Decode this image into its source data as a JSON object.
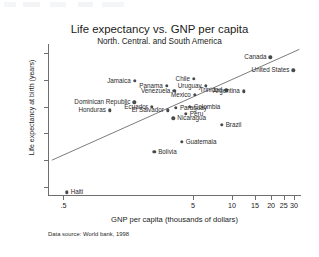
{
  "chart_data": {
    "type": "scatter",
    "title": "Life expectancy vs. GNP per capita",
    "subtitle": "North, Central, and South America",
    "xlabel": "GNP per capita (thousands of dollars)",
    "ylabel": "Life expectancy at birth (years)",
    "note": "Data source:  World bank, 1998",
    "xscale": "log",
    "yscale": "linear",
    "xlim": [
      0.38,
      34
    ],
    "ylim": [
      53.4,
      81.6
    ],
    "grid": false,
    "legend": false,
    "xticks": [
      ".5",
      "5",
      "10",
      "15",
      "20",
      "25",
      "30"
    ],
    "xtickvalues": [
      0.5,
      5,
      10,
      15,
      20,
      25,
      30
    ],
    "yticks": [
      "55",
      "60",
      "65",
      "70",
      "75",
      "80"
    ],
    "ytickvalues": [
      55,
      60,
      65,
      70,
      75,
      80
    ],
    "points": [
      {
        "name": "Canada",
        "x": 19.4,
        "y": 79.1,
        "side": "left"
      },
      {
        "name": "United States",
        "x": 29.2,
        "y": 76.7,
        "side": "left"
      },
      {
        "name": "Jamaica",
        "x": 1.74,
        "y": 74.8,
        "side": "left"
      },
      {
        "name": "Chile",
        "x": 4.99,
        "y": 75.1,
        "side": "left"
      },
      {
        "name": "Panama",
        "x": 3.08,
        "y": 73.9,
        "side": "left"
      },
      {
        "name": "Uruguay",
        "x": 6.13,
        "y": 73.9,
        "side": "left"
      },
      {
        "name": "Venezuela",
        "x": 3.52,
        "y": 72.9,
        "side": "left"
      },
      {
        "name": "Trinidad",
        "x": 8.85,
        "y": 73.0,
        "side": "left"
      },
      {
        "name": "Argentina",
        "x": 12.1,
        "y": 72.8,
        "side": "left"
      },
      {
        "name": "Mexico",
        "x": 5.07,
        "y": 72.2,
        "side": "left"
      },
      {
        "name": "Dominican Republic",
        "x": 1.73,
        "y": 70.8,
        "side": "left"
      },
      {
        "name": "Ecuador",
        "x": 2.36,
        "y": 69.9,
        "side": "left"
      },
      {
        "name": "Paraguay",
        "x": 3.62,
        "y": 69.8,
        "side": "right"
      },
      {
        "name": "Colombia",
        "x": 4.63,
        "y": 70.0,
        "side": "right"
      },
      {
        "name": "Honduras",
        "x": 1.12,
        "y": 69.3,
        "side": "left"
      },
      {
        "name": "El Salvador",
        "x": 3.14,
        "y": 69.3,
        "side": "left"
      },
      {
        "name": "Peru",
        "x": 4.32,
        "y": 68.6,
        "side": "right"
      },
      {
        "name": "Nicaragua",
        "x": 3.46,
        "y": 67.8,
        "side": "right"
      },
      {
        "name": "Brazil",
        "x": 8.16,
        "y": 66.6,
        "side": "right"
      },
      {
        "name": "Guatemala",
        "x": 4.01,
        "y": 63.5,
        "side": "right"
      },
      {
        "name": "Bolivia",
        "x": 2.46,
        "y": 61.6,
        "side": "right"
      },
      {
        "name": "Haiti",
        "x": 0.52,
        "y": 54.1,
        "side": "right"
      }
    ],
    "fitline": {
      "label": "linear fit (log x)",
      "x0": 0.4,
      "y0": 59.9,
      "x1": 33.0,
      "y1": 80.6
    }
  }
}
